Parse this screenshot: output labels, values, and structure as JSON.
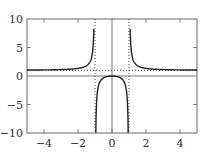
{
  "chart_data": {
    "type": "line",
    "title": "",
    "xlabel": "",
    "ylabel": "",
    "function": "y = x^2/(x^2-1)",
    "xlim": [
      -5,
      5
    ],
    "ylim": [
      -10,
      10
    ],
    "x_ticks": [
      "-4",
      "-2",
      "0",
      "2",
      "4"
    ],
    "y_ticks": [
      "10",
      "5",
      "0",
      "-5",
      "-10"
    ],
    "grid": false,
    "legend": null,
    "asymptotes": {
      "horizontal": [
        1
      ],
      "vertical": [
        -1,
        1
      ],
      "style": "dotted"
    },
    "axes_lines": {
      "x_axis": 0,
      "y_axis": 0
    },
    "series": [
      {
        "name": "curve-left",
        "x": [
          -5,
          -4,
          -3,
          -2,
          -1.5,
          -1.2,
          -1.1,
          -1.05
        ],
        "y": [
          1.04,
          1.07,
          1.13,
          1.33,
          1.8,
          3.27,
          5.76,
          10.76
        ]
      },
      {
        "name": "curve-middle",
        "x": [
          -0.95,
          -0.9,
          -0.8,
          -0.5,
          0,
          0.5,
          0.8,
          0.9,
          0.95
        ],
        "y": [
          -9.26,
          -4.26,
          -1.78,
          -0.33,
          0,
          -0.33,
          -1.78,
          -4.26,
          -9.26
        ]
      },
      {
        "name": "curve-right",
        "x": [
          1.05,
          1.1,
          1.2,
          1.5,
          2,
          3,
          4,
          5
        ],
        "y": [
          10.76,
          5.76,
          3.27,
          1.8,
          1.33,
          1.13,
          1.07,
          1.04
        ]
      }
    ],
    "colors": {
      "curve": "#222222",
      "frame": "#555555",
      "asymptote": "#333333"
    }
  }
}
